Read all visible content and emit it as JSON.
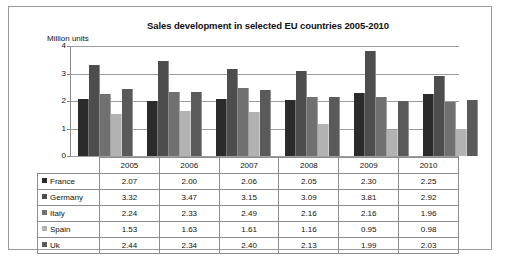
{
  "chart_data": {
    "type": "bar",
    "title": "Sales development in selected EU countries 2005-2010",
    "xlabel": "",
    "ylabel": "Million units",
    "ylim": [
      0,
      4
    ],
    "yticks": [
      "0",
      "1",
      "2",
      "3",
      "4"
    ],
    "grid": true,
    "legend_position": "table-row-headers",
    "categories": [
      "2005",
      "2006",
      "2007",
      "2008",
      "2009",
      "2010"
    ],
    "series": [
      {
        "name": "France",
        "color": "#2b2b2b",
        "values": [
          2.07,
          2.0,
          2.06,
          2.05,
          2.3,
          2.25
        ]
      },
      {
        "name": "Germany",
        "color": "#4d4d4d",
        "values": [
          3.32,
          3.47,
          3.15,
          3.09,
          3.81,
          2.92
        ]
      },
      {
        "name": "Italy",
        "color": "#707070",
        "values": [
          2.24,
          2.33,
          2.49,
          2.16,
          2.16,
          1.96
        ]
      },
      {
        "name": "Spain",
        "color": "#b2b2b2",
        "values": [
          1.53,
          1.63,
          1.61,
          1.16,
          0.95,
          0.98
        ]
      },
      {
        "name": "Uk",
        "color": "#5a5a5a",
        "values": [
          2.44,
          2.34,
          2.4,
          2.13,
          1.99,
          2.03
        ]
      }
    ]
  },
  "table": {
    "corner_label": "",
    "column_headers": [
      "2005",
      "2006",
      "2007",
      "2008",
      "2009",
      "2010"
    ],
    "rows": [
      {
        "label": "France",
        "swatch": "#2b2b2b",
        "cells": [
          "2.07",
          "2.00",
          "2.06",
          "2.05",
          "2.30",
          "2.25"
        ]
      },
      {
        "label": "Germany",
        "swatch": "#4d4d4d",
        "cells": [
          "3.32",
          "3.47",
          "3.15",
          "3.09",
          "3.81",
          "2.92"
        ]
      },
      {
        "label": "Italy",
        "swatch": "#707070",
        "cells": [
          "2.24",
          "2.33",
          "2.49",
          "2.16",
          "2.16",
          "1.96"
        ]
      },
      {
        "label": "Spain",
        "swatch": "#b2b2b2",
        "cells": [
          "1.53",
          "1.63",
          "1.61",
          "1.16",
          "0.95",
          "0.98"
        ]
      },
      {
        "label": "Uk",
        "swatch": "#5a5a5a",
        "cells": [
          "2.44",
          "2.34",
          "2.40",
          "2.13",
          "1.99",
          "2.03"
        ]
      }
    ]
  }
}
